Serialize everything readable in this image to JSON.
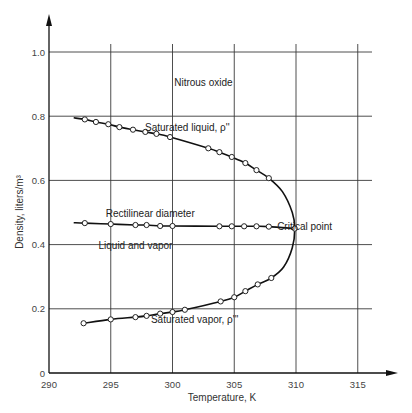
{
  "chart_data": {
    "type": "line",
    "title": "Nitrous oxide",
    "xlabel": "Temperature, K",
    "ylabel": "Density, liters/m³",
    "xlim": [
      290,
      317
    ],
    "ylim": [
      0,
      1.05
    ],
    "x_ticks": [
      "290",
      "295",
      "300",
      "305",
      "310",
      "315"
    ],
    "y_ticks": [
      "0",
      "0.2",
      "0.4",
      "0.6",
      "0.8",
      "1.0"
    ],
    "grid": true,
    "series": [
      {
        "name": "Saturated liquid, ρ''",
        "x": [
          292.9,
          293.8,
          294.8,
          295.7,
          296.8,
          297.8,
          298.7,
          299.8,
          302.9,
          303.8,
          304.8,
          305.9,
          306.8,
          307.8
        ],
        "values": [
          0.79,
          0.782,
          0.775,
          0.766,
          0.758,
          0.751,
          0.745,
          0.735,
          0.7,
          0.688,
          0.673,
          0.654,
          0.632,
          0.607
        ]
      },
      {
        "name": "Rectilinear diameter",
        "x": [
          292.9,
          295.0,
          297.0,
          297.9,
          299.0,
          300.0,
          303.8,
          304.8,
          305.8,
          306.8,
          307.8
        ],
        "values": [
          0.467,
          0.464,
          0.461,
          0.461,
          0.458,
          0.458,
          0.457,
          0.457,
          0.457,
          0.457,
          0.456
        ]
      },
      {
        "name": "Saturated vapor, ρ'''",
        "x": [
          292.8,
          295.0,
          297.0,
          297.9,
          299.0,
          300.0,
          301.0,
          303.9,
          305.0,
          305.9,
          306.9,
          308.0
        ],
        "values": [
          0.155,
          0.167,
          0.174,
          0.178,
          0.185,
          0.19,
          0.197,
          0.223,
          0.236,
          0.255,
          0.276,
          0.296
        ]
      }
    ],
    "critical_point": {
      "x": 309.9,
      "y": 0.45
    },
    "annotations": [
      {
        "text": "Nitrous oxide",
        "x": 302.5,
        "y": 0.895
      },
      {
        "text": "Saturated liquid, ρ''",
        "x": 301.2,
        "y": 0.755
      },
      {
        "text": "Rectilinear diameter",
        "x": 298.2,
        "y": 0.485
      },
      {
        "text": "Critical point",
        "x": 310.7,
        "y": 0.447
      },
      {
        "text": "Liquid and vapor",
        "x": 297.0,
        "y": 0.385
      },
      {
        "text": "Saturated vapor, ρ'''",
        "x": 301.8,
        "y": 0.155
      }
    ]
  }
}
